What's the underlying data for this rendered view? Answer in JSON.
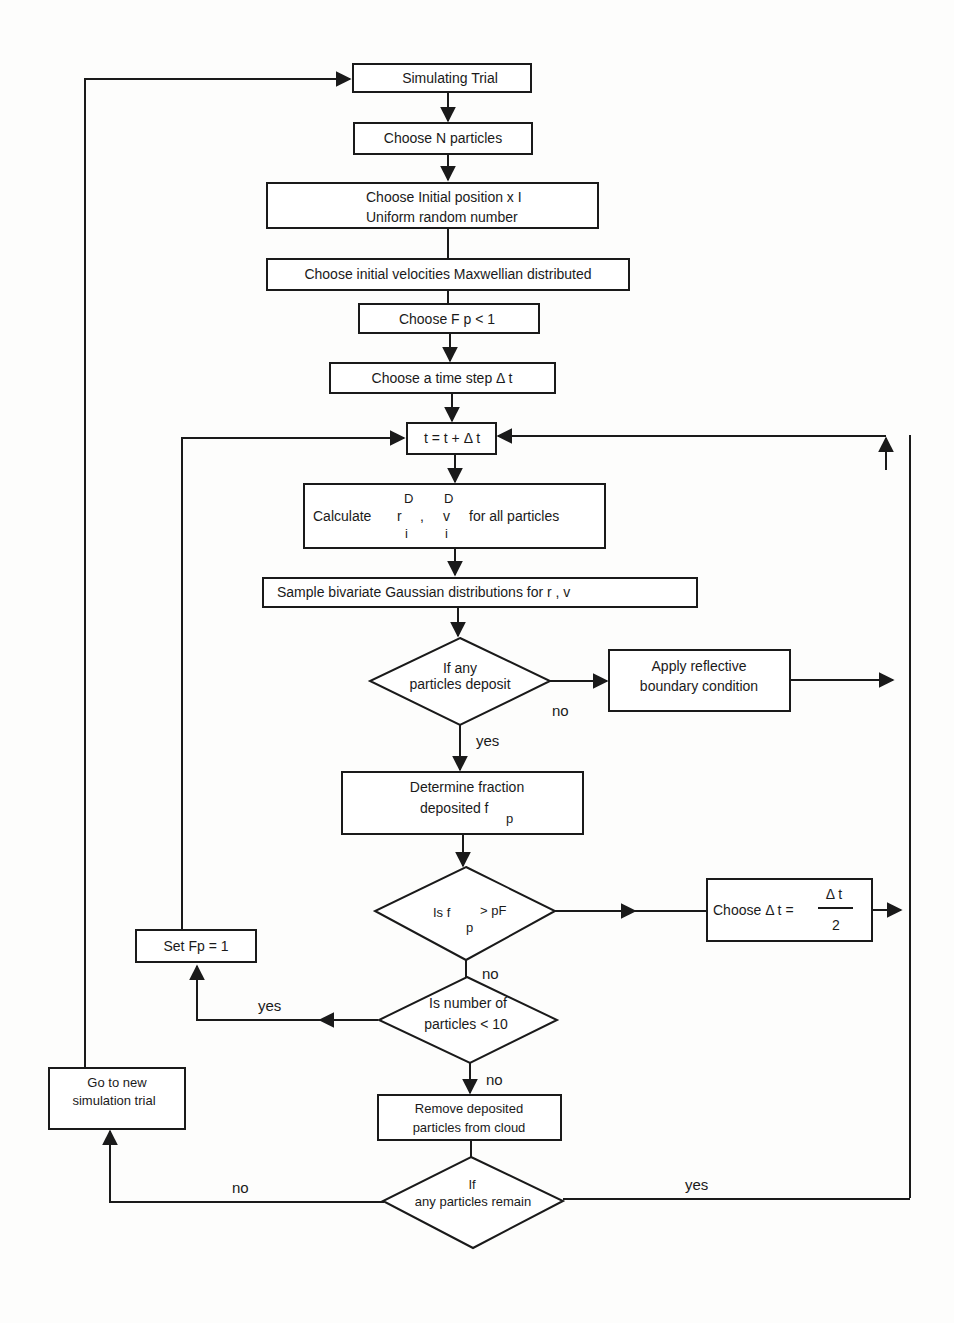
{
  "flowchart": {
    "nodes": {
      "simulating_trial": "Simulating Trial",
      "choose_n": "Choose  N  particles",
      "choose_pos_1": "Choose  Initial position  x  I",
      "choose_pos_2": "Uniform  random  number",
      "choose_vel": "Choose initial  velocities Maxwellian distributed",
      "choose_fp": "Choose  F p  < 1",
      "choose_dt": "Choose  a  time  step  Δ t",
      "t_update": "t = t +  Δ t",
      "calc_prefix": "Calculate",
      "calc_r": "r",
      "calc_comma": ",",
      "calc_v": "v",
      "calc_sup": "D",
      "calc_sub": "i",
      "calc_suffix": "for  all  particles",
      "sample": "Sample  bivariate  Gaussian distributions for   r     ,    v",
      "if_deposit_1": "If any",
      "if_deposit_2": "particles  deposit",
      "reflective_1": "Apply  reflective",
      "reflective_2": "boundary  condition",
      "fraction_1": "Determine  fraction",
      "fraction_2": "deposited  f",
      "fraction_sub": "p",
      "is_fp_1": "Is  f",
      "is_fp_2": "> pF",
      "is_fp_sub": "p",
      "halve_dt_prefix": "Choose  Δ t =",
      "halve_dt_num": "Δ t",
      "halve_dt_den": "2",
      "set_fp": "Set  Fp  =  1",
      "num_particles_1": "Is number of",
      "num_particles_2": "particles  < 10",
      "remove_1": "Remove deposited",
      "remove_2": "particles  from cloud",
      "remain_1": "If",
      "remain_2": "any  particles remain",
      "new_trial_1": "Go  to  new",
      "new_trial_2": "simulation trial"
    },
    "edge_labels": {
      "deposit_no": "no",
      "deposit_yes": "yes",
      "fp_no": "no",
      "num_yes": "yes",
      "num_no": "no",
      "remain_no": "no",
      "remain_yes": "yes"
    }
  }
}
